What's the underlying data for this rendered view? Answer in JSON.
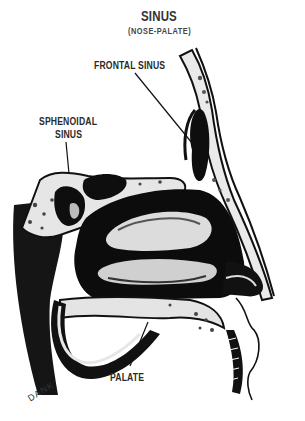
{
  "title": "SINUS",
  "subtitle": "(NOSE-PALATE)",
  "labels": {
    "frontal_sinus": "FRONTAL SINUS",
    "sphenoidal_line1": "SPHENOIDAL",
    "sphenoidal_line2": "SINUS",
    "palate": "PALATE"
  },
  "signature": "DANK",
  "colors": {
    "ink": "#111111",
    "bone": "#e8e8e8",
    "paper": "#ffffff"
  }
}
